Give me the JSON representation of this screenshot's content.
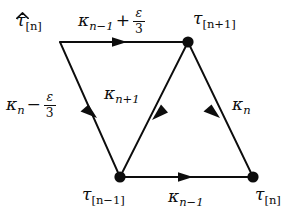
{
  "figure": {
    "type": "directed-graph-diagram",
    "background_color": "#ffffff",
    "stroke_color": "#0d0d0d",
    "width": 304,
    "height": 215,
    "vertices": [
      {
        "id": "tau-hat-n",
        "label": "τ̂",
        "subscript": "[n]",
        "x": 60,
        "y": 42,
        "dot": false,
        "label_x": 16,
        "label_y": 12
      },
      {
        "id": "tau-n-plus-1",
        "label": "τ",
        "subscript": "[n+1]",
        "x": 188,
        "y": 42,
        "dot": true,
        "label_x": 193,
        "label_y": 10
      },
      {
        "id": "tau-n-minus-1",
        "label": "τ",
        "subscript": "[n−1]",
        "x": 120,
        "y": 177,
        "dot": true,
        "label_x": 82,
        "label_y": 186
      },
      {
        "id": "tau-n",
        "label": "τ",
        "subscript": "[n]",
        "x": 253,
        "y": 177,
        "dot": true,
        "label_x": 255,
        "label_y": 186
      }
    ],
    "edges": [
      {
        "id": "edge-top",
        "from": "tau-hat-n",
        "to": "tau-n-plus-1",
        "label": "κ_{n−1} + ε/3",
        "arrow_t": 0.45
      },
      {
        "id": "edge-left",
        "from": "tau-hat-n",
        "to": "tau-n-minus-1",
        "label": "κ_n − ε/3",
        "arrow_t": 0.52
      },
      {
        "id": "edge-middle",
        "from": "tau-n-plus-1",
        "to": "tau-n-minus-1",
        "label": "κ_{n+1}",
        "arrow_t": 0.5
      },
      {
        "id": "edge-right",
        "from": "tau-n-plus-1",
        "to": "tau-n",
        "label": "κ_n",
        "arrow_t": 0.5
      },
      {
        "id": "edge-bottom",
        "from": "tau-n-minus-1",
        "to": "tau-n",
        "label": "κ_{n−1}",
        "arrow_t": 0.49
      }
    ]
  },
  "labels": {
    "tau_hat_n": {
      "base": "τ",
      "sub": "[n]"
    },
    "tau_n_plus_1": {
      "base": "τ",
      "sub": "[n+1]"
    },
    "tau_n_minus_1": {
      "base": "τ",
      "sub": "[n−1]"
    },
    "tau_n": {
      "base": "τ",
      "sub": "[n]"
    },
    "kappa_n_minus_1": {
      "base": "κ",
      "sub": "n−1"
    },
    "kappa_n_plus_1": {
      "base": "κ",
      "sub": "n+1"
    },
    "kappa_n": {
      "base": "κ",
      "sub": "n"
    },
    "epsilon": "ε",
    "three": "3",
    "plus": "+",
    "minus": "−"
  }
}
